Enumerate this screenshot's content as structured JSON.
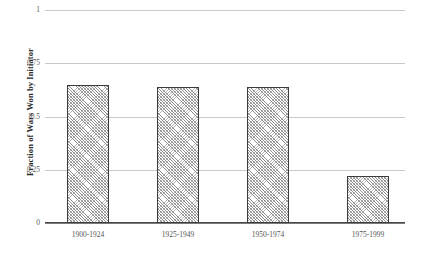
{
  "chart_data": {
    "type": "bar",
    "title": "",
    "subtitle": "",
    "xlabel": "",
    "ylabel": "Fraction of Wars Won by Initiator",
    "categories": [
      "1900-1924",
      "1925-1949",
      "1950-1974",
      "1975-1999"
    ],
    "values": [
      0.65,
      0.64,
      0.64,
      0.22
    ],
    "series": [
      {
        "name": "Fraction of Wars Won by Initiator",
        "values": [
          0.65,
          0.64,
          0.64,
          0.22
        ]
      }
    ],
    "ylim": [
      0,
      1
    ],
    "yticks": [
      0,
      0.25,
      0.5,
      0.75,
      1
    ],
    "ytick_labels": [
      "0",
      "0.25",
      "0.5",
      "0.75",
      "1"
    ],
    "grid": "horizontal",
    "legend": "none",
    "bar_fill": "#b0b0b0",
    "bar_edge_color": "#3c3c3c",
    "gridline_color": "#c8c8c8",
    "axis_color": "#4a4a4a",
    "background": "#ffffff"
  }
}
